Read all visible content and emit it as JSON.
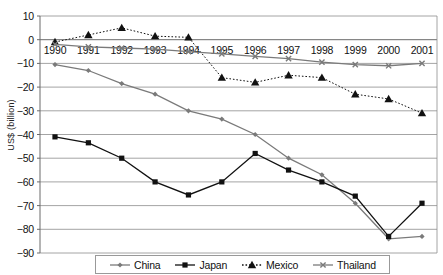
{
  "chart_data": {
    "type": "line",
    "title": "",
    "xlabel": "",
    "ylabel": "US$ (billion)",
    "ylim": [
      -90,
      10
    ],
    "ytick_step": 10,
    "grid": true,
    "legend_position": "bottom",
    "categories": [
      "1990",
      "1991",
      "1992",
      "1993",
      "1994",
      "1995",
      "1996",
      "1997",
      "1998",
      "1999",
      "2000",
      "2001"
    ],
    "yticks": [
      "10",
      "0",
      "-10",
      "-20",
      "-30",
      "-40",
      "-50",
      "-60",
      "-70",
      "-80",
      "-90"
    ],
    "series": [
      {
        "name": "China",
        "color": "#7a7a7a",
        "marker": "diamond",
        "dash": "solid",
        "values": [
          -10.5,
          -13,
          -18.5,
          -23,
          -30,
          -33.5,
          -40,
          -50,
          -57,
          -69,
          -84,
          -83
        ]
      },
      {
        "name": "Japan",
        "color": "#111111",
        "marker": "square",
        "dash": "solid",
        "values": [
          -41,
          -43.5,
          -50,
          -60,
          -65.5,
          -60,
          -48,
          -55,
          -60,
          -66,
          -83,
          -69
        ]
      },
      {
        "name": "Mexico",
        "color": "#111111",
        "marker": "triangle",
        "dash": "dotted",
        "values": [
          -1,
          2,
          5,
          1.5,
          1,
          -16,
          -18,
          -15,
          -16,
          -23,
          -25,
          -31
        ]
      },
      {
        "name": "Thailand",
        "color": "#7a7a7a",
        "marker": "cross",
        "dash": "solid",
        "values": [
          -2,
          -3,
          -3.5,
          -4,
          -5,
          -6,
          -7,
          -8,
          -9.5,
          -10.5,
          -11,
          -10
        ]
      }
    ]
  }
}
